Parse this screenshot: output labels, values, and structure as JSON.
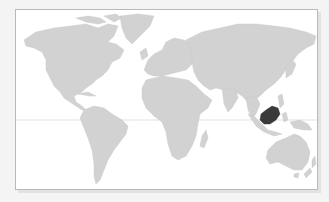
{
  "map": {
    "type": "world-locator-map",
    "projection": "equirectangular-like",
    "highlighted_region": "Borneo (Malaysia)",
    "colors": {
      "background": "#f4f4f4",
      "frame_fill": "#ffffff",
      "frame_border": "#b9b9b9",
      "land": "#d2d2d2",
      "highlight": "#3a3a3a",
      "equator": "#cfcfcf"
    },
    "features": {
      "equator_line": true,
      "continents": [
        "North America",
        "Greenland",
        "South America",
        "Europe",
        "Africa",
        "Asia",
        "Australia",
        "New Zealand",
        "Madagascar",
        "Japan",
        "Indonesia"
      ]
    }
  }
}
